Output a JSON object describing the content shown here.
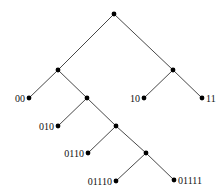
{
  "diagram": {
    "type": "binary-tree",
    "colors": {
      "edge": "#333333",
      "node": "#000000",
      "label": "#111111",
      "background": "#ffffff"
    },
    "nodes": [
      {
        "id": "root",
        "x": 114,
        "y": 14,
        "label": ""
      },
      {
        "id": "n0",
        "x": 58,
        "y": 70,
        "label": ""
      },
      {
        "id": "n1",
        "x": 173,
        "y": 70,
        "label": ""
      },
      {
        "id": "n00",
        "x": 29,
        "y": 98,
        "label": "00",
        "label_side": "left"
      },
      {
        "id": "n01",
        "x": 87,
        "y": 98,
        "label": ""
      },
      {
        "id": "n10",
        "x": 144,
        "y": 98,
        "label": "10",
        "label_side": "left"
      },
      {
        "id": "n11",
        "x": 202,
        "y": 98,
        "label": "11",
        "label_side": "right"
      },
      {
        "id": "n010",
        "x": 58,
        "y": 126,
        "label": "010",
        "label_side": "left"
      },
      {
        "id": "n011",
        "x": 116,
        "y": 126,
        "label": ""
      },
      {
        "id": "n0110",
        "x": 88,
        "y": 153,
        "label": "0110",
        "label_side": "left"
      },
      {
        "id": "n0111",
        "x": 146,
        "y": 153,
        "label": ""
      },
      {
        "id": "n01110",
        "x": 116,
        "y": 181,
        "label": "01110",
        "label_side": "left"
      },
      {
        "id": "n01111",
        "x": 174,
        "y": 180,
        "label": "01111",
        "label_side": "right"
      }
    ],
    "edges": [
      [
        "root",
        "n0"
      ],
      [
        "root",
        "n1"
      ],
      [
        "n0",
        "n00"
      ],
      [
        "n0",
        "n01"
      ],
      [
        "n1",
        "n10"
      ],
      [
        "n1",
        "n11"
      ],
      [
        "n01",
        "n010"
      ],
      [
        "n01",
        "n011"
      ],
      [
        "n011",
        "n0110"
      ],
      [
        "n011",
        "n0111"
      ],
      [
        "n0111",
        "n01110"
      ],
      [
        "n0111",
        "n01111"
      ]
    ]
  }
}
